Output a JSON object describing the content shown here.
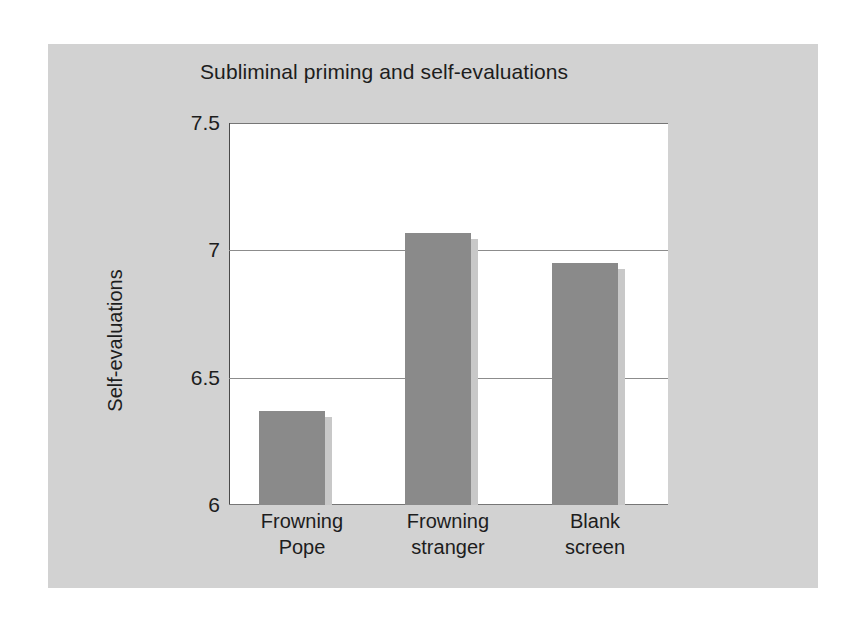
{
  "figure": {
    "panel_color": "#d2d2d2",
    "plot_background": "#ffffff",
    "bar_color": "#8a8a8a",
    "axis_color": "#4a4a4a",
    "gridline_color": "#8c8c8c",
    "text_color": "#1d1d1d"
  },
  "chart_data": {
    "type": "bar",
    "title": "Subliminal priming and self-evaluations",
    "xlabel": "",
    "ylabel": "Self-evaluations",
    "categories": [
      "Frowning Pope",
      "Frowning stranger",
      "Blank screen"
    ],
    "category_lines": [
      [
        "Frowning",
        "Pope"
      ],
      [
        "Frowning",
        "stranger"
      ],
      [
        "Blank",
        "screen"
      ]
    ],
    "values": [
      6.37,
      7.07,
      6.95
    ],
    "ylim": [
      6,
      7.5
    ],
    "yticks": [
      7.5,
      7,
      6.5,
      6
    ],
    "ytick_labels": [
      "7.5",
      "7",
      "6.5",
      "6"
    ],
    "grid": true,
    "gridlines_at": [
      7.0,
      6.5
    ],
    "legend": null,
    "legend_position": "none",
    "series": [
      {
        "name": "Self-evaluations",
        "values": [
          6.37,
          7.07,
          6.95
        ]
      }
    ]
  }
}
